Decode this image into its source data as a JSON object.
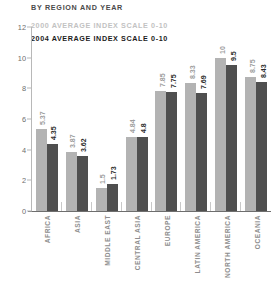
{
  "header": {
    "title": "BY REGION AND YEAR"
  },
  "legend": [
    {
      "label": "2000 AVERAGE INDEX SCALE 0-10",
      "color": "#c2c2c2"
    },
    {
      "label": "2004 AVERAGE INDEX SCALE 0-10",
      "color": "#1c1c1c"
    }
  ],
  "chart_data": {
    "type": "bar",
    "title": "BY REGION AND YEAR",
    "xlabel": "",
    "ylabel": "",
    "ylim": [
      0,
      12
    ],
    "yticks": [
      "0",
      "2",
      "4",
      "6",
      "8",
      "10",
      "12"
    ],
    "grid": false,
    "legend_position": "top-left",
    "categories": [
      "AFRICA",
      "ASIA",
      "MIDDLE EAST",
      "CENTRAL ASIA",
      "EUROPE",
      "LATIN AMERICA",
      "NORTH AMERICA",
      "OCEANIA"
    ],
    "series": [
      {
        "name": "2000 AVERAGE INDEX SCALE 0-10",
        "color": "#b3b3b3",
        "values": [
          5.37,
          3.87,
          1.5,
          4.84,
          7.85,
          8.33,
          10,
          8.75
        ],
        "labels": [
          "5.37",
          "3.87",
          "1.5",
          "4.84",
          "7.85",
          "8.33",
          "10",
          "8.75"
        ]
      },
      {
        "name": "2004 AVERAGE INDEX SCALE 0-10",
        "color": "#4f4f4f",
        "values": [
          4.35,
          3.62,
          1.73,
          4.8,
          7.75,
          7.69,
          9.5,
          8.43
        ],
        "labels": [
          "4.35",
          "3.62",
          "1.73",
          "4.8",
          "7.75",
          "7.69",
          "9.5",
          "8.43"
        ]
      }
    ]
  }
}
